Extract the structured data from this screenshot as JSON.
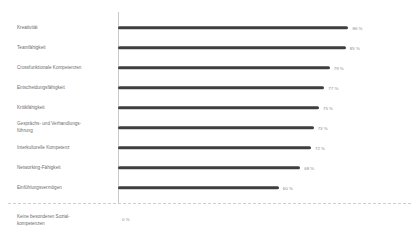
{
  "chart_data": {
    "type": "bar",
    "orientation": "horizontal",
    "title": "",
    "subtitle": "",
    "xlabel": "",
    "ylabel": "",
    "xlim": [
      0,
      100
    ],
    "grid": false,
    "legend": null,
    "value_suffix": "%",
    "bar_color": "#3f3f3f",
    "label_color": "#6d6d6d",
    "value_color": "#8a8a8a",
    "axis_color": "#c9c9c9",
    "divider_color": "#cfcfcf",
    "categories": [
      "Kreativität",
      "Teamfähigkeit",
      "Crossfunktionale Kompetenzen",
      "Entscheidungsfähigkeit",
      "Kritikfähigkeit",
      "Gesprächs- und Verhandlungs-\nführung",
      "Interkulturelle Kompetenz",
      "Networking-Fähigkeit",
      "Einfühlungsvermögen",
      "Keine besonderen Sozial-\nkompetenzen"
    ],
    "values": [
      86,
      85,
      79,
      77,
      75,
      73,
      72,
      68,
      60,
      0
    ],
    "value_labels": [
      "86 %",
      "85 %",
      "79 %",
      "77 %",
      "75 %",
      "73 %",
      "72 %",
      "68 %",
      "60 %",
      "0 %"
    ]
  },
  "rows": [
    {
      "label": "Kreativität",
      "value": 86,
      "value_label": "86 %"
    },
    {
      "label": "Teamfähigkeit",
      "value": 85,
      "value_label": "85 %"
    },
    {
      "label": "Crossfunktionale Kompetenzen",
      "value": 79,
      "value_label": "79 %"
    },
    {
      "label": "Entscheidungsfähigkeit",
      "value": 77,
      "value_label": "77 %"
    },
    {
      "label": "Kritikfähigkeit",
      "value": 75,
      "value_label": "75 %"
    },
    {
      "label": "Gesprächs- und Verhandlungs-\nführung",
      "value": 73,
      "value_label": "73 %"
    },
    {
      "label": "Interkulturelle Kompetenz",
      "value": 72,
      "value_label": "72 %"
    },
    {
      "label": "Networking-Fähigkeit",
      "value": 68,
      "value_label": "68 %"
    },
    {
      "label": "Einfühlungsvermögen",
      "value": 60,
      "value_label": "60 %"
    }
  ],
  "zero_row": {
    "label": "Keine besonderen Sozial-\nkompetenzen",
    "value": 0,
    "value_label": "0 %"
  }
}
